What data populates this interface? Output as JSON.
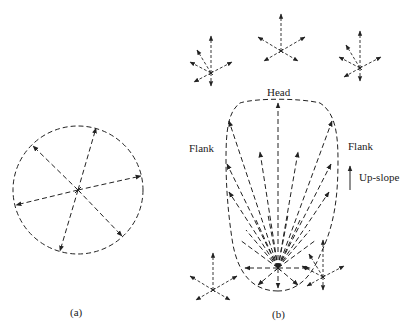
{
  "figure": {
    "panel_a": {
      "label": "(a)",
      "shape": "circle",
      "center": [
        78,
        190
      ],
      "radius": 65
    },
    "panel_b": {
      "label": "(b)",
      "shape": "tear-drop",
      "source_point": [
        278,
        268
      ],
      "labels": {
        "head": "Head",
        "flank_left": "Flank",
        "flank_right": "Flank",
        "upslope": "Up-slope"
      }
    },
    "small_stars": [
      {
        "center": [
          211,
          73
        ],
        "variant": "asymmetric-upslope"
      },
      {
        "center": [
          281,
          51
        ],
        "variant": "symmetric"
      },
      {
        "center": [
          360,
          68
        ],
        "variant": "asymmetric-upslope"
      },
      {
        "center": [
          212,
          290
        ],
        "variant": "symmetric"
      },
      {
        "center": [
          323,
          277
        ],
        "variant": "asymmetric-upslope"
      }
    ],
    "colors": {
      "stroke": "#222222",
      "background": "#ffffff"
    }
  }
}
